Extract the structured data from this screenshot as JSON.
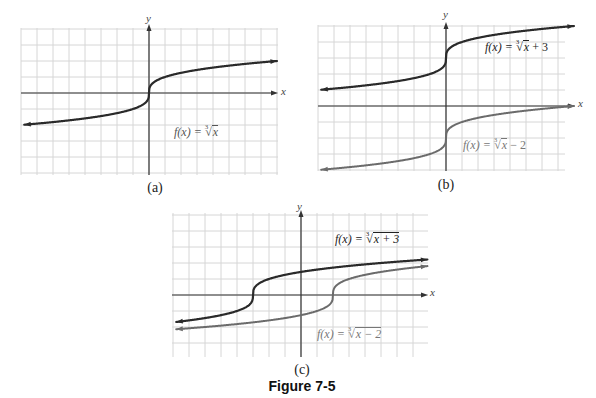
{
  "figure_caption": "Figure 7-5",
  "colors": {
    "dark_curve": "#2a2a2a",
    "gray_curve": "#6b6b6b",
    "grid": "#d6d6d6",
    "axis": "#333333",
    "label_gray": "#666666"
  },
  "panels": [
    {
      "id": "a",
      "caption": "(a)",
      "x_axis_label": "x",
      "y_axis_label": "y",
      "labels": [
        {
          "prefix": "f(x) = ",
          "index": "3",
          "radicand": "x",
          "suffix": ""
        }
      ]
    },
    {
      "id": "b",
      "caption": "(b)",
      "x_axis_label": "x",
      "y_axis_label": "y",
      "labels": [
        {
          "prefix": "f(x) = ",
          "index": "3",
          "radicand": "x",
          "suffix": " + 3"
        },
        {
          "prefix": "f(x) = ",
          "index": "3",
          "radicand": "x",
          "suffix": " − 2"
        }
      ]
    },
    {
      "id": "c",
      "caption": "(c)",
      "x_axis_label": "x",
      "y_axis_label": "y",
      "labels": [
        {
          "prefix": "f(x) = ",
          "index": "3",
          "radicand": "x + 3",
          "suffix": ""
        },
        {
          "prefix": "f(x) = ",
          "index": "3",
          "radicand": "x − 2",
          "suffix": ""
        }
      ]
    }
  ],
  "chart_data": [
    {
      "type": "line",
      "title": "(a)",
      "xlabel": "x",
      "ylabel": "y",
      "grid": true,
      "xlim": [
        -8,
        8
      ],
      "ylim": [
        -5,
        4
      ],
      "series": [
        {
          "name": "f(x) = ∛x",
          "color": "#2a2a2a",
          "x": [
            -8,
            -1,
            0,
            1,
            8
          ],
          "y": [
            -2,
            -1,
            0,
            1,
            2
          ]
        }
      ]
    },
    {
      "type": "line",
      "title": "(b)",
      "xlabel": "x",
      "ylabel": "y",
      "grid": true,
      "xlim": [
        -8,
        8
      ],
      "ylim": [
        -4,
        5
      ],
      "series": [
        {
          "name": "f(x) = ∛x + 3",
          "color": "#2a2a2a",
          "x": [
            -8,
            -1,
            0,
            1,
            8
          ],
          "y": [
            1,
            2,
            3,
            4,
            5
          ]
        },
        {
          "name": "f(x) = ∛x − 2",
          "color": "#6b6b6b",
          "x": [
            -8,
            -1,
            0,
            1,
            8
          ],
          "y": [
            -4,
            -3,
            -2,
            -1,
            0
          ]
        }
      ]
    },
    {
      "type": "line",
      "title": "(c)",
      "xlabel": "x",
      "ylabel": "y",
      "grid": true,
      "xlim": [
        -8,
        8
      ],
      "ylim": [
        -4,
        4
      ],
      "series": [
        {
          "name": "f(x) = ∛(x + 3)",
          "color": "#2a2a2a",
          "x": [
            -8,
            -4,
            -3,
            -2,
            5
          ],
          "y": [
            -1.71,
            -1,
            0,
            1,
            2
          ]
        },
        {
          "name": "f(x) = ∛(x − 2)",
          "color": "#6b6b6b",
          "x": [
            -8,
            1,
            2,
            3,
            8
          ],
          "y": [
            -2.15,
            -1,
            0,
            1,
            1.82
          ]
        }
      ]
    }
  ]
}
